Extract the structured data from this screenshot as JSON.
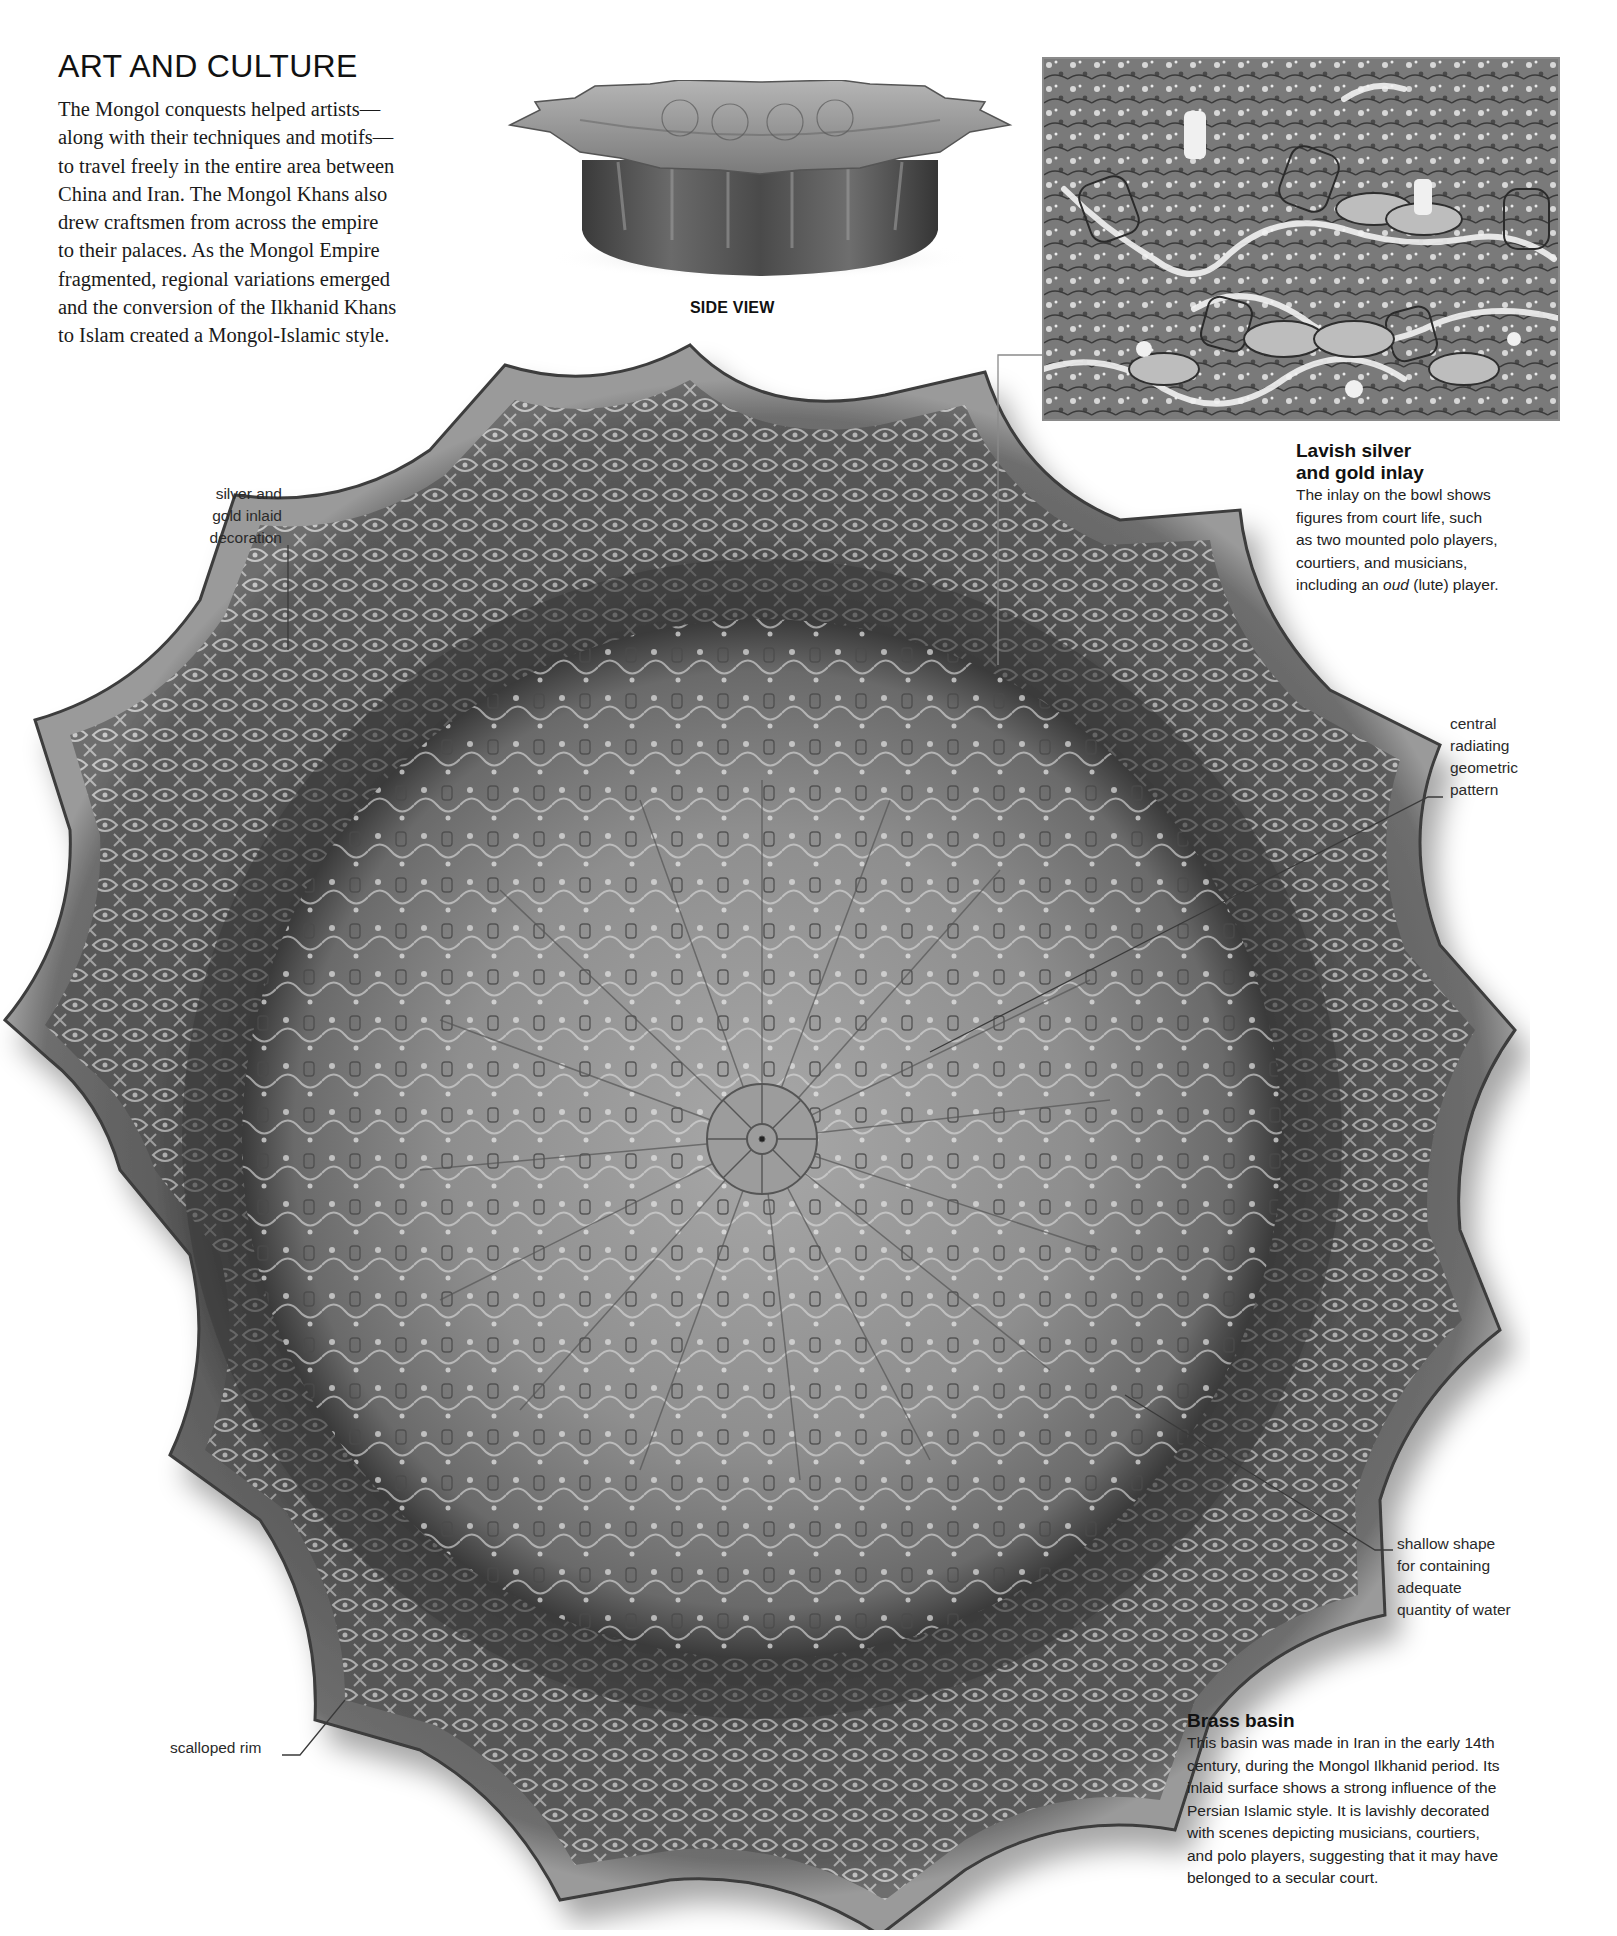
{
  "section": {
    "title": "ART AND CULTURE",
    "intro_lines": [
      "The Mongol conquests helped artists—",
      "along with their techniques and motifs—",
      "to travel freely in the entire area between",
      "China and Iran. The Mongol Khans also",
      "drew craftsmen from across the empire",
      "to their palaces. As the Mongol Empire",
      "fragmented, regional variations emerged",
      "and the conversion of the Ilkhanid Khans",
      "to Islam created a Mongol-Islamic style."
    ]
  },
  "side_view": {
    "caption": "SIDE VIEW"
  },
  "inset": {
    "heading_lines": [
      "Lavish silver",
      "and gold inlay"
    ],
    "body_lines": [
      "The inlay on the bowl shows",
      "figures from court life, such",
      "as two mounted polo players,",
      "courtiers, and musicians,",
      "including an ",
      "oud",
      " (lute) player."
    ]
  },
  "annotations": {
    "silver_gold": [
      "silver and",
      "gold inlaid",
      "decoration"
    ],
    "central": [
      "central",
      "radiating",
      "geometric",
      "pattern"
    ],
    "shallow": [
      "shallow shape",
      "for containing",
      "adequate",
      "quantity of water"
    ],
    "scalloped": "scalloped rim"
  },
  "main_caption": {
    "heading": "Brass basin",
    "body_lines": [
      "This basin was made in Iran in the early 14th",
      "century, during the Mongol Ilkhanid period. Its",
      "inlaid surface shows a strong influence of the",
      "Persian Islamic style. It is lavishly decorated",
      "with scenes depicting musicians, courtiers,",
      "and polo players, suggesting that it may have",
      "belonged to a secular court."
    ]
  },
  "colors": {
    "page_bg": "#ffffff",
    "text": "#1c1c1c",
    "metal_dark": "#2e2e2e",
    "metal_mid": "#7a7a7a",
    "metal_light": "#bdbdbd",
    "leader_line": "#3a3a3a"
  }
}
